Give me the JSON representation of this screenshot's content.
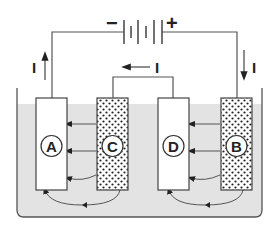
{
  "diagram": {
    "battery": {
      "negative_label": "−",
      "positive_label": "+"
    },
    "current_labels": {
      "left": "I",
      "right": "I",
      "middle": "I"
    },
    "electrodes": [
      {
        "id": "A",
        "label": "A",
        "fill": "plain"
      },
      {
        "id": "C",
        "label": "C",
        "fill": "dotted"
      },
      {
        "id": "D",
        "label": "D",
        "fill": "plain"
      },
      {
        "id": "B",
        "label": "B",
        "fill": "dotted"
      }
    ],
    "colors": {
      "electrolyte": "#e3e3e3",
      "line": "#555555",
      "text": "#222222"
    }
  }
}
